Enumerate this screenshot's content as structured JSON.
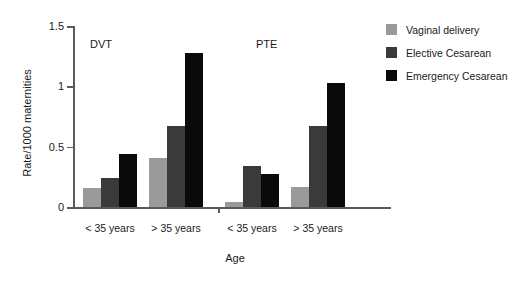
{
  "chart_data": {
    "type": "bar",
    "title": "",
    "xlabel": "Age",
    "ylabel": "Rate/1000 maternities",
    "ylim": [
      0,
      1.5
    ],
    "yticks": [
      "0",
      "0.5",
      "1",
      "1.5"
    ],
    "ytick_values": [
      0,
      0.5,
      1,
      1.5
    ],
    "grid": false,
    "legend_position": "top-right",
    "panels": [
      {
        "label": "DVT",
        "categories": [
          "< 35 years",
          "> 35 years"
        ],
        "series": [
          {
            "name": "Vaginal delivery",
            "color": "#9a9a9a",
            "values": [
              0.16,
              0.41
            ]
          },
          {
            "name": "Elective Cesarean",
            "color": "#3a3a3a",
            "values": [
              0.24,
              0.67
            ]
          },
          {
            "name": "Emergency Cesarean",
            "color": "#0a0a0a",
            "values": [
              0.44,
              1.28
            ]
          }
        ]
      },
      {
        "label": "PTE",
        "categories": [
          "< 35 years",
          "> 35 years"
        ],
        "series": [
          {
            "name": "Vaginal delivery",
            "color": "#9a9a9a",
            "values": [
              0.04,
              0.17
            ]
          },
          {
            "name": "Elective Cesarean",
            "color": "#3a3a3a",
            "values": [
              0.34,
              0.67
            ]
          },
          {
            "name": "Emergency Cesarean",
            "color": "#0a0a0a",
            "values": [
              0.27,
              1.03
            ]
          }
        ]
      }
    ],
    "legend": [
      {
        "name": "Vaginal delivery",
        "color": "#9a9a9a"
      },
      {
        "name": "Elective Cesarean",
        "color": "#3a3a3a"
      },
      {
        "name": "Emergency Cesarean",
        "color": "#0a0a0a"
      }
    ]
  },
  "axis_color": "#5a5a5a"
}
